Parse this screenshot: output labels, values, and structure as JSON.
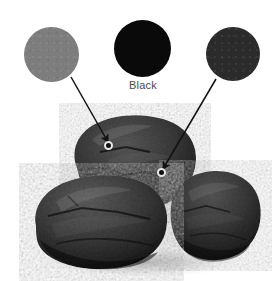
{
  "figure": {
    "title": "Black"
  },
  "swatches": [
    {
      "id": "left",
      "name": "gray-swatch",
      "label": "",
      "color": "#7d7d7d",
      "cx": 51.5,
      "cy": 54.5,
      "r": 27.5
    },
    {
      "id": "center",
      "name": "black-swatch",
      "label": "Black",
      "color": "#0a0a0a",
      "cx": 142.5,
      "cy": 48,
      "r": 28.5
    },
    {
      "id": "right",
      "name": "charcoal-swatch",
      "label": "",
      "color": "#2b2b2b",
      "cx": 233,
      "cy": 54,
      "r": 27
    }
  ],
  "leader_lines": [
    {
      "name": "leader-line-left",
      "from_swatch": "gray-swatch",
      "x1": 71,
      "y1": 77,
      "x2": 108,
      "y2": 142,
      "arrow": true,
      "color": "#111111"
    },
    {
      "name": "leader-line-right",
      "from_swatch": "charcoal-swatch",
      "x1": 216,
      "y1": 79,
      "x2": 163,
      "y2": 169,
      "arrow": true,
      "color": "#111111"
    }
  ],
  "sample_points": [
    {
      "name": "sample-point-upper",
      "x": 108,
      "y": 145,
      "sampled_color": "#7d7d7d"
    },
    {
      "name": "sample-point-lower",
      "x": 161,
      "y": 172,
      "sampled_color": "#2b2b2b"
    }
  ],
  "photo": {
    "name": "coal-lumps-photograph",
    "subject": "three black coal lumps",
    "background": "#ffffff",
    "rocks": [
      {
        "name": "rock-top-center",
        "tone": "#3a3a3a"
      },
      {
        "name": "rock-bottom-left",
        "tone": "#3f3f3f"
      },
      {
        "name": "rock-bottom-right",
        "tone": "#383838"
      }
    ]
  },
  "colors": {
    "page_background": "#ffffff",
    "label_text": "#4a4a4a",
    "leader_line": "#111111",
    "ring_outline": "#e8e8e8"
  }
}
